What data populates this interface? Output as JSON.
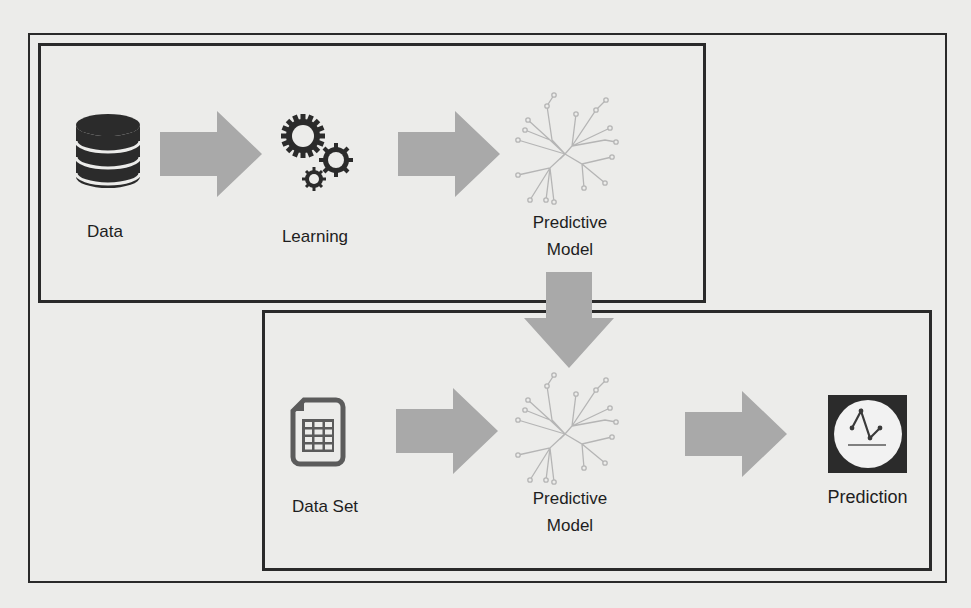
{
  "diagram": {
    "training_stage": {
      "nodes": [
        {
          "id": "data",
          "label": "Data",
          "icon": "database-icon"
        },
        {
          "id": "learning",
          "label": "Learning",
          "icon": "gears-icon"
        },
        {
          "id": "predictive_model",
          "label_line1": "Predictive",
          "label_line2": "Model",
          "icon": "tree-network-icon"
        }
      ],
      "edges": [
        [
          "data",
          "learning"
        ],
        [
          "learning",
          "predictive_model"
        ]
      ]
    },
    "prediction_stage": {
      "nodes": [
        {
          "id": "data_set",
          "label": "Data Set",
          "icon": "spreadsheet-file-icon"
        },
        {
          "id": "predictive_model_2",
          "label_line1": "Predictive",
          "label_line2": "Model",
          "icon": "tree-network-icon"
        },
        {
          "id": "prediction",
          "label": "Prediction",
          "icon": "line-chart-icon"
        }
      ],
      "edges": [
        [
          "data_set",
          "predictive_model_2"
        ],
        [
          "predictive_model_2",
          "prediction"
        ]
      ]
    },
    "cross_edges": [
      [
        "predictive_model",
        "predictive_model_2"
      ]
    ],
    "colors": {
      "arrow": "#a9a9a9",
      "icon_dark": "#2b2b2b",
      "border": "#2a2a2a",
      "network": "#b5b5b5",
      "background": "#ececea"
    }
  }
}
